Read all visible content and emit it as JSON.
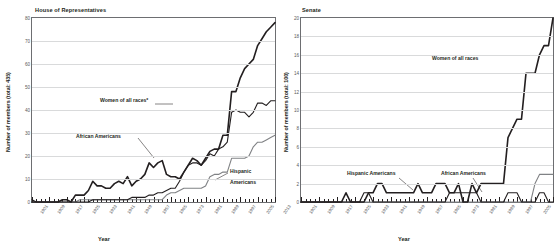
{
  "chart_data": [
    {
      "type": "line",
      "title": "House of Representatives",
      "xlabel": "Year",
      "ylabel": "Number of members (total: 435)",
      "ylim": [
        0,
        80
      ],
      "yticks": [
        0,
        10,
        20,
        30,
        40,
        50,
        60,
        70,
        80
      ],
      "xlim": [
        1901,
        2013
      ],
      "xticks": [
        1901,
        1909,
        1917,
        1925,
        1933,
        1941,
        1949,
        1957,
        1965,
        1973,
        1981,
        1989,
        1997,
        2005,
        2013
      ],
      "grid": true,
      "legend": "annotations",
      "x": [
        1901,
        1903,
        1905,
        1907,
        1909,
        1911,
        1913,
        1915,
        1917,
        1919,
        1921,
        1923,
        1925,
        1927,
        1929,
        1931,
        1933,
        1935,
        1937,
        1939,
        1941,
        1943,
        1945,
        1947,
        1949,
        1951,
        1953,
        1955,
        1957,
        1959,
        1961,
        1963,
        1965,
        1967,
        1969,
        1971,
        1973,
        1975,
        1977,
        1979,
        1981,
        1983,
        1985,
        1987,
        1989,
        1991,
        1993,
        1995,
        1997,
        1999,
        2001,
        2003,
        2005,
        2007,
        2009,
        2011,
        2013
      ],
      "series": [
        {
          "name": "Women of all races*",
          "color": "#231f20",
          "values": [
            0,
            0,
            0,
            0,
            0,
            0,
            0,
            1,
            1,
            0,
            3,
            3,
            3,
            5,
            9,
            7,
            7,
            6,
            6,
            8,
            9,
            8,
            11,
            7,
            9,
            10,
            12,
            17,
            15,
            17,
            18,
            12,
            11,
            11,
            10,
            13,
            16,
            19,
            18,
            16,
            19,
            22,
            23,
            23,
            29,
            29,
            48,
            48,
            54,
            58,
            60,
            62,
            68,
            71,
            74,
            76,
            78
          ]
        },
        {
          "name": "African Americans",
          "color": "#231f20",
          "values": [
            1,
            0,
            0,
            0,
            0,
            0,
            0,
            0,
            0,
            0,
            0,
            0,
            0,
            0,
            1,
            1,
            1,
            1,
            1,
            1,
            1,
            1,
            1,
            2,
            2,
            2,
            2,
            3,
            3,
            4,
            4,
            5,
            6,
            6,
            9,
            13,
            16,
            17,
            17,
            16,
            18,
            21,
            20,
            23,
            24,
            26,
            39,
            40,
            39,
            39,
            37,
            39,
            43,
            43,
            42,
            44,
            44
          ]
        },
        {
          "name": "Hispanic Americans",
          "color": "#808285",
          "values": [
            0,
            0,
            0,
            0,
            0,
            0,
            0,
            0,
            0,
            0,
            0,
            1,
            1,
            1,
            1,
            1,
            1,
            1,
            1,
            1,
            1,
            1,
            1,
            1,
            1,
            1,
            1,
            1,
            1,
            1,
            1,
            3,
            4,
            4,
            5,
            6,
            6,
            6,
            6,
            6,
            7,
            11,
            12,
            12,
            13,
            13,
            19,
            19,
            19,
            19,
            20,
            24,
            26,
            26,
            27,
            28,
            29
          ]
        }
      ],
      "annotations": [
        {
          "text": "Women of all races*",
          "series": "Women of all races*"
        },
        {
          "text": "African Americans",
          "series": "African Americans"
        },
        {
          "text": "Hispanic Americans",
          "series": "Hispanic Americans"
        }
      ]
    },
    {
      "type": "line",
      "title": "Senate",
      "xlabel": "Year",
      "ylabel": "Number of members (total: 100)",
      "ylim": [
        0,
        20
      ],
      "yticks": [
        0,
        2,
        4,
        6,
        8,
        10,
        12,
        14,
        16,
        18,
        20
      ],
      "xlim": [
        1901,
        2013
      ],
      "xticks": [
        1901,
        1909,
        1917,
        1925,
        1933,
        1941,
        1949,
        1957,
        1965,
        1973,
        1981,
        1989,
        1997,
        2005,
        2013
      ],
      "grid": true,
      "legend": "annotations",
      "x": [
        1901,
        1903,
        1905,
        1907,
        1909,
        1911,
        1913,
        1915,
        1917,
        1919,
        1921,
        1923,
        1925,
        1927,
        1929,
        1931,
        1933,
        1935,
        1937,
        1939,
        1941,
        1943,
        1945,
        1947,
        1949,
        1951,
        1953,
        1955,
        1957,
        1959,
        1961,
        1963,
        1965,
        1967,
        1969,
        1971,
        1973,
        1975,
        1977,
        1979,
        1981,
        1983,
        1985,
        1987,
        1989,
        1991,
        1993,
        1995,
        1997,
        1999,
        2001,
        2003,
        2005,
        2007,
        2009,
        2011,
        2013
      ],
      "series": [
        {
          "name": "Women of all races",
          "color": "#231f20",
          "values": [
            0,
            0,
            0,
            0,
            0,
            0,
            0,
            0,
            0,
            0,
            1,
            0,
            0,
            0,
            0,
            1,
            1,
            2,
            2,
            1,
            1,
            1,
            1,
            1,
            1,
            1,
            2,
            1,
            1,
            1,
            2,
            2,
            2,
            1,
            1,
            2,
            0,
            0,
            2,
            1,
            2,
            2,
            2,
            2,
            2,
            2,
            7,
            8,
            9,
            9,
            14,
            14,
            14,
            16,
            17,
            17,
            20
          ]
        },
        {
          "name": "Hispanic Americans",
          "color": "#808285",
          "values": [
            0,
            0,
            0,
            0,
            0,
            0,
            0,
            0,
            0,
            0,
            0,
            0,
            0,
            0,
            0,
            0,
            0,
            0,
            0,
            0,
            0,
            0,
            0,
            0,
            0,
            0,
            0,
            0,
            0,
            0,
            0,
            0,
            0,
            0,
            0,
            0,
            0,
            0,
            0,
            0,
            0,
            0,
            0,
            0,
            0,
            0,
            0,
            0,
            0,
            0,
            0,
            0,
            2,
            3,
            3,
            3,
            3
          ]
        },
        {
          "name": "African Americans",
          "color": "#231f20",
          "values": [
            0,
            0,
            0,
            0,
            0,
            0,
            0,
            0,
            0,
            0,
            0,
            0,
            0,
            0,
            1,
            1,
            0,
            0,
            0,
            0,
            0,
            0,
            0,
            0,
            0,
            0,
            0,
            0,
            0,
            0,
            0,
            0,
            0,
            1,
            1,
            1,
            1,
            1,
            1,
            1,
            0,
            0,
            0,
            0,
            0,
            0,
            1,
            1,
            1,
            0,
            0,
            0,
            0,
            1,
            1,
            0,
            0
          ]
        }
      ],
      "annotations": [
        {
          "text": "Women of all races",
          "series": "Women of all races"
        },
        {
          "text": "Hispanic Americans",
          "series": "Hispanic Americans"
        },
        {
          "text": "African Americans",
          "series": "African Americans"
        }
      ]
    }
  ],
  "house": {
    "title": "House of Representatives",
    "ylabel": "Number of members (total: 435)",
    "xlabel": "Year",
    "ann_women": "Women of all races*",
    "ann_black": "African Americans",
    "ann_hisp_1": "Hispanic",
    "ann_hisp_2": "Americans"
  },
  "senate": {
    "title": "Senate",
    "ylabel": "Number of members (total: 100)",
    "xlabel": "Year",
    "ann_women": "Women of all races",
    "ann_hisp": "Hispanic Americans",
    "ann_black": "African Americans"
  }
}
